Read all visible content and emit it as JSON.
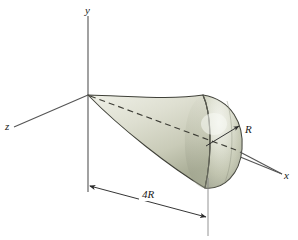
{
  "figure": {
    "background_color": "#ffffff",
    "axes": {
      "y_label": "y",
      "x_label": "x",
      "z_label": "z",
      "line_color": "#555555",
      "origin": {
        "x": 88,
        "y": 95
      }
    },
    "labels": {
      "radius": "R",
      "length": "4R"
    },
    "solid": {
      "name": "cone-with-spherical-cap",
      "body_color": "#d8dac9",
      "body_light": "#f2f3ec",
      "body_shadow": "#9a9e88",
      "cap_highlight": "#f6f7f1",
      "outline_color": "#3a3a32",
      "centerline_style": "dashed"
    },
    "dimension_line": {
      "value": "4R",
      "arrow_color": "#2a2a2a",
      "start": {
        "x": 88,
        "y": 186
      },
      "end": {
        "x": 208,
        "y": 218
      }
    }
  }
}
